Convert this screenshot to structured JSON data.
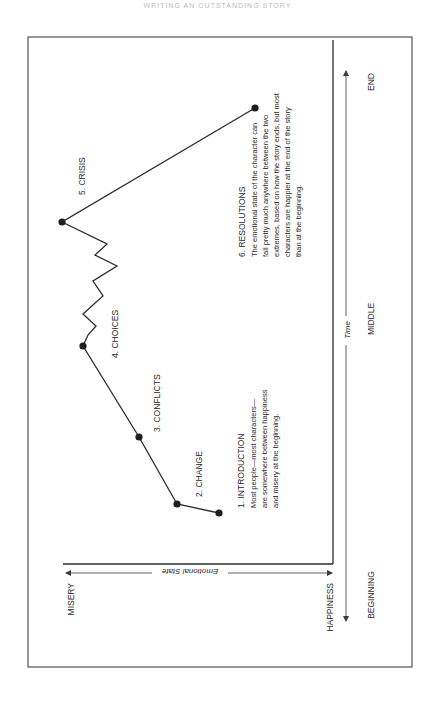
{
  "page": {
    "running_header": "WRITING AN OUTSTANDING STORY"
  },
  "axes": {
    "emotional_state": {
      "label": "Emotional State",
      "low_label": "MISERY",
      "high_label": "HAPPINESS"
    },
    "time": {
      "label": "Time",
      "start_label": "BEGINNING",
      "mid_label": "MIDDLE",
      "end_label": "END"
    }
  },
  "stages": [
    {
      "title": "1. INTRODUCTION",
      "body": [
        "Most people—most characters—",
        "are somewhere between happiness",
        "and misery at the beginning."
      ]
    },
    {
      "title": "2. CHANGE"
    },
    {
      "title": "3. CONFLICTS"
    },
    {
      "title": "4. CHOICES"
    },
    {
      "title": "5. CRISIS"
    },
    {
      "title": "6. RESOLUTIONS",
      "body": [
        "The emotional state of the character can",
        "fall pretty much anywhere between the two",
        "extremes, based on how the story ends, but most",
        "characters are happier at the end of the story",
        "than at the beginning."
      ]
    }
  ],
  "colors": {
    "frame": "#6e6e6e",
    "line": "#2b2b2b",
    "text": "#2a2a2a",
    "arrow": "#3a3a3a"
  }
}
